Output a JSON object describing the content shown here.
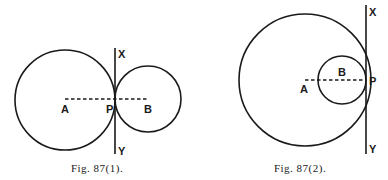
{
  "figures": [
    {
      "caption": "Fig. 87(1).",
      "labels": {
        "A": "A",
        "B": "B",
        "P": "P",
        "X": "X",
        "Y": "Y"
      },
      "description": "Two circles touching externally at P with common tangent XY"
    },
    {
      "caption": "Fig. 87(2).",
      "labels": {
        "A": "A",
        "B": "B",
        "P": "P",
        "X": "X",
        "Y": "Y"
      },
      "description": "Two circles touching internally at P with common tangent XY"
    }
  ],
  "colors": {
    "ink": "#1a1a1a",
    "paper": "#ffffff"
  }
}
